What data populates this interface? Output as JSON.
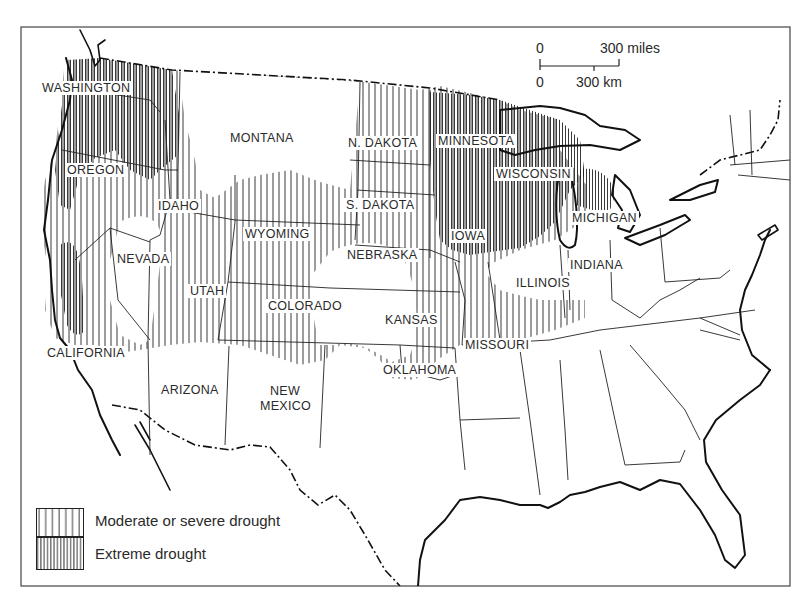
{
  "map": {
    "subject": "Drought extent across the contiguous United States",
    "states": [
      {
        "name": "WASHINGTON",
        "x": 40,
        "y": 81
      },
      {
        "name": "OREGON",
        "x": 65,
        "y": 163
      },
      {
        "name": "MONTANA",
        "x": 228,
        "y": 131
      },
      {
        "name": "N. DAKOTA",
        "x": 346,
        "y": 136
      },
      {
        "name": "MINNESOTA",
        "x": 436,
        "y": 134
      },
      {
        "name": "IDAHO",
        "x": 156,
        "y": 199
      },
      {
        "name": "S. DAKOTA",
        "x": 344,
        "y": 198
      },
      {
        "name": "WISCONSIN",
        "x": 494,
        "y": 167
      },
      {
        "name": "WYOMING",
        "x": 243,
        "y": 227
      },
      {
        "name": "MICHIGAN",
        "x": 570,
        "y": 211
      },
      {
        "name": "IOWA",
        "x": 449,
        "y": 229
      },
      {
        "name": "NEVADA",
        "x": 115,
        "y": 252
      },
      {
        "name": "NEBRASKA",
        "x": 345,
        "y": 248
      },
      {
        "name": "INDIANA",
        "x": 568,
        "y": 258
      },
      {
        "name": "UTAH",
        "x": 188,
        "y": 284
      },
      {
        "name": "ILLINOIS",
        "x": 514,
        "y": 276
      },
      {
        "name": "COLORADO",
        "x": 266,
        "y": 299
      },
      {
        "name": "KANSAS",
        "x": 383,
        "y": 313
      },
      {
        "name": "CALIFORNIA",
        "x": 45,
        "y": 346
      },
      {
        "name": "MISSOURI",
        "x": 463,
        "y": 338
      },
      {
        "name": "OKLAHOMA",
        "x": 381,
        "y": 363
      },
      {
        "name": "ARIZONA",
        "x": 159,
        "y": 383
      },
      {
        "name": "NEW",
        "x": 268,
        "y": 384
      },
      {
        "name": "MEXICO",
        "x": 258,
        "y": 399
      }
    ],
    "scale_bar": {
      "miles_zero": "0",
      "miles_value": "300 miles",
      "km_zero": "0",
      "km_value": "300 km"
    },
    "legend": {
      "items": [
        {
          "label": "Moderate or severe drought",
          "pattern": "sparse-vertical-hatch"
        },
        {
          "label": "Extreme drought",
          "pattern": "dense-vertical-hatch"
        }
      ]
    },
    "colors": {
      "ink": "#1a1a1a",
      "paper": "#ffffff"
    }
  }
}
